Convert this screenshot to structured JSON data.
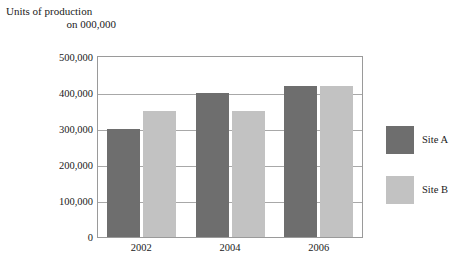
{
  "chart_data": {
    "type": "bar",
    "title": "Units of production on 000,000",
    "title_lines": [
      "Units of production",
      "on 000,000"
    ],
    "xlabel": "",
    "ylabel": "",
    "categories": [
      "2002",
      "2004",
      "2006"
    ],
    "series": [
      {
        "name": "Site A",
        "color": "#6e6e6e",
        "values": [
          300000,
          400000,
          420000
        ]
      },
      {
        "name": "Site B",
        "color": "#c2c2c2",
        "values": [
          350000,
          350000,
          420000
        ]
      }
    ],
    "ylim": [
      0,
      500000
    ],
    "yticks": [
      0,
      100000,
      200000,
      300000,
      400000,
      500000
    ],
    "ytick_labels": [
      "0",
      "100,000",
      "200,000",
      "300,000",
      "400,000",
      "500,000"
    ],
    "grid": true,
    "legend_position": "right",
    "legend": [
      {
        "label": "Site A",
        "color": "#6e6e6e"
      },
      {
        "label": "Site B",
        "color": "#c2c2c2"
      }
    ]
  },
  "colors": {
    "series_a": "#6e6e6e",
    "series_b": "#c2c2c2",
    "gridline": "#a8a8a8",
    "plot_border": "#9a9a9a",
    "text": "#1a1a1a",
    "background": "#ffffff"
  }
}
